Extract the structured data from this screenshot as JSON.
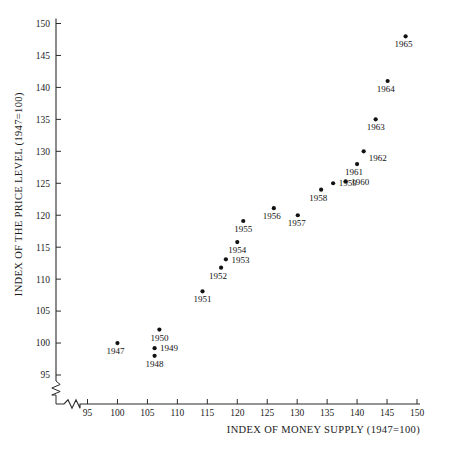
{
  "chart_data": {
    "type": "scatter",
    "title": "",
    "xlabel": "INDEX OF MONEY SUPPLY (1947=100)",
    "ylabel": "INDEX OF THE PRICE LEVEL (1947=100)",
    "xlim": [
      93,
      150
    ],
    "ylim": [
      93.5,
      150
    ],
    "xticks": [
      95,
      100,
      105,
      110,
      115,
      120,
      125,
      130,
      135,
      140,
      145,
      150
    ],
    "yticks": [
      95,
      100,
      105,
      110,
      115,
      120,
      125,
      130,
      135,
      140,
      145,
      150
    ],
    "xtick_labels": [
      "95",
      "100",
      "105",
      "110",
      "115",
      "120",
      "125",
      "130",
      "135",
      "140",
      "145",
      "150"
    ],
    "ytick_labels": [
      "95",
      "100",
      "105",
      "110",
      "115",
      "120",
      "125",
      "130",
      "135",
      "140",
      "145",
      "150"
    ],
    "grid": false,
    "legend": null,
    "axis_break": {
      "x_axis": true,
      "y_axis": true,
      "note": "zigzag break marks near origin on both axes"
    },
    "marker_color": "#111111",
    "axis_color": "#2b2b2b",
    "points": [
      {
        "label": "1947",
        "x": 100.0,
        "y": 100.0,
        "label_pos": "below-left"
      },
      {
        "label": "1948",
        "x": 106.2,
        "y": 98.0,
        "label_pos": "below"
      },
      {
        "label": "1949",
        "x": 106.2,
        "y": 99.2,
        "label_pos": "right"
      },
      {
        "label": "1950",
        "x": 107.0,
        "y": 102.1,
        "label_pos": "below"
      },
      {
        "label": "1951",
        "x": 114.2,
        "y": 108.1,
        "label_pos": "below"
      },
      {
        "label": "1952",
        "x": 117.3,
        "y": 111.8,
        "label_pos": "below-left"
      },
      {
        "label": "1953",
        "x": 118.1,
        "y": 113.1,
        "label_pos": "right"
      },
      {
        "label": "1954",
        "x": 120.0,
        "y": 115.8,
        "label_pos": "below"
      },
      {
        "label": "1955",
        "x": 121.0,
        "y": 119.1,
        "label_pos": "below"
      },
      {
        "label": "1956",
        "x": 126.1,
        "y": 121.1,
        "label_pos": "below-left"
      },
      {
        "label": "1957",
        "x": 130.1,
        "y": 120.0,
        "label_pos": "below-left"
      },
      {
        "label": "1958",
        "x": 134.0,
        "y": 124.0,
        "label_pos": "below-left"
      },
      {
        "label": "1959",
        "x": 136.0,
        "y": 125.0,
        "label_pos": "right"
      },
      {
        "label": "1960",
        "x": 138.1,
        "y": 125.3,
        "label_pos": "right"
      },
      {
        "label": "1961",
        "x": 140.0,
        "y": 128.0,
        "label_pos": "below-left"
      },
      {
        "label": "1962",
        "x": 141.1,
        "y": 130.0,
        "label_pos": "below-right"
      },
      {
        "label": "1963",
        "x": 143.1,
        "y": 135.0,
        "label_pos": "below"
      },
      {
        "label": "1964",
        "x": 145.1,
        "y": 141.0,
        "label_pos": "below-left"
      },
      {
        "label": "1965",
        "x": 148.1,
        "y": 148.0,
        "label_pos": "below-left"
      }
    ]
  }
}
